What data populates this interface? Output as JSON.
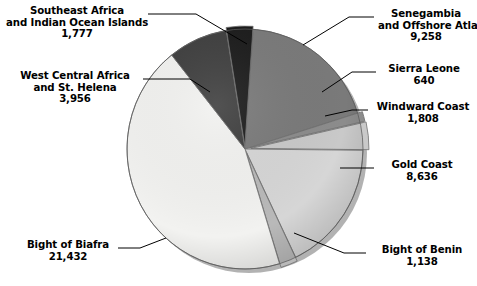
{
  "chart_data": {
    "type": "pie",
    "title": "",
    "subtitle": "",
    "xlabel": "",
    "ylabel": "",
    "legend_position": "none",
    "grid": false,
    "total": 48645,
    "categories": [
      "Senegambia and Offshore Atlantic",
      "Sierra Leone",
      "Windward Coast",
      "Gold Coast",
      "Bight of Benin",
      "Bight of Biafra",
      "West Central Africa and St. Helena",
      "Southeast Africa and Indian Ocean Islands"
    ],
    "values": [
      9258,
      640,
      1808,
      8636,
      1138,
      21432,
      3956,
      1777
    ],
    "slices": [
      {
        "name": "Senegambia and Offshore Atlantic",
        "value": 9258,
        "value_text": "9,258",
        "color": "#7a7a7a"
      },
      {
        "name": "Sierra Leone",
        "value": 640,
        "value_text": "640",
        "color": "#8c8c8c"
      },
      {
        "name": "Windward Coast",
        "value": 1808,
        "value_text": "1,808",
        "color": "#c9c9c9"
      },
      {
        "name": "Gold Coast",
        "value": 8636,
        "value_text": "8,636",
        "color": "#d6d6d6"
      },
      {
        "name": "Bight of Benin",
        "value": 1138,
        "value_text": "1,138",
        "color": "#b9b9b9"
      },
      {
        "name": "Bight of Biafra",
        "value": 21432,
        "value_text": "21,432",
        "color": "#f2f2f0"
      },
      {
        "name": "West Central Africa and St. Helena",
        "value": 3956,
        "value_text": "3,956",
        "color": "#3f3f3f"
      },
      {
        "name": "Southeast Africa and Indian Ocean Islands",
        "value": 1777,
        "value_text": "1,777",
        "color": "#1c1c1c"
      }
    ]
  },
  "labels": {
    "southeast_africa": {
      "line1": "Southeast Africa",
      "line2": "and Indian Ocean Islands",
      "value": "1,777"
    },
    "west_central_africa": {
      "line1": "West Central Africa",
      "line2": "and St. Helena",
      "value": "3,956"
    },
    "senegambia": {
      "line1": "Senegambia",
      "line2": "and Offshore Atlantic",
      "value": "9,258"
    },
    "sierra_leone": {
      "line1": "Sierra Leone",
      "value": "640"
    },
    "windward_coast": {
      "line1": "Windward Coast",
      "value": "1,808"
    },
    "gold_coast": {
      "line1": "Gold Coast",
      "value": "8,636"
    },
    "bight_of_benin": {
      "line1": "Bight of Benin",
      "value": "1,138"
    },
    "bight_of_biafra": {
      "line1": "Bight of Biafra",
      "value": "21,432"
    }
  }
}
